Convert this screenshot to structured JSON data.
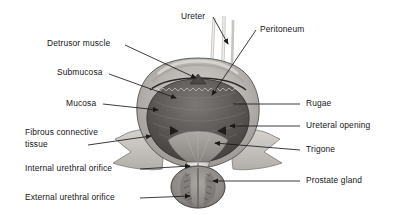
{
  "figure": {
    "background_color": "#ffffff",
    "text_color": "#151515",
    "leader_color": "#1a1a1a"
  },
  "labels": {
    "detrusor_muscle": "Detrusor muscle",
    "submucosa": "Submucosa",
    "mucosa": "Mucosa",
    "fibrous_connective_tissue_line1": "Fibrous connective",
    "fibrous_connective_tissue_line2": "tissue",
    "internal_urethral_orifice": "Internal urethral orifice",
    "external_urethral_orifice": "External urethral orifice",
    "ureter": "Ureter",
    "peritoneum": "Peritoneum",
    "rugae": "Rugae",
    "ureteral_opening": "Ureteral opening",
    "trigone": "Trigone",
    "prostate_gland": "Prostate gland"
  },
  "anatomy": {
    "bladder_dome": "bladder-dome",
    "bladder_cavity": "bladder-cavity",
    "ureter_tubes": "ureter-tubes",
    "peritoneum_fold": "peritoneum-fold",
    "trigone_region": "trigone-region",
    "urethra": "urethra",
    "prostate": "prostate-gland-mass",
    "fibrous_flange_left": "fibrous-flange-left",
    "fibrous_flange_right": "fibrous-flange-right"
  },
  "colors": {
    "serosa": "#b9b6b2",
    "detrusor": "#8e8b88",
    "mucosa_dark": "#4a4846",
    "cavity": "#6a6664",
    "trigone": "#9a9693",
    "prostate": "#878482",
    "flange": "#cac7c3",
    "outline": "#3b3937"
  }
}
